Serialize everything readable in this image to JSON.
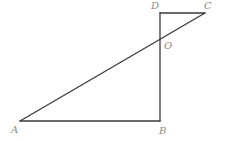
{
  "figure": {
    "type": "geometry",
    "stroke_color": "#3a3a3a",
    "label_color": "#8a8a8a",
    "points": {
      "A": {
        "label": "A",
        "x": 20,
        "y": 121
      },
      "B": {
        "label": "B",
        "x": 160,
        "y": 121
      },
      "C": {
        "label": "C",
        "x": 205,
        "y": 13
      },
      "D": {
        "label": "D",
        "x": 160,
        "y": 13
      },
      "O": {
        "label": "O",
        "x": 160,
        "y": 39
      }
    },
    "segments": [
      "AB",
      "BD",
      "DC",
      "AC"
    ]
  }
}
